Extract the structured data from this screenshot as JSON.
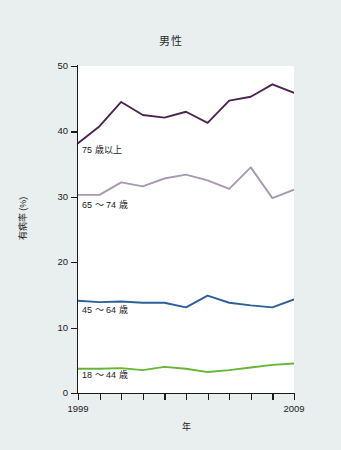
{
  "figure": {
    "background_color": "#e9efee",
    "plot_background_color": "#ffffff",
    "axis_color": "#1b1b1b"
  },
  "chart_data": {
    "type": "line",
    "title": "男性",
    "xlabel": "年",
    "ylabel": "有病率 (%)",
    "xlim": [
      1999,
      2009
    ],
    "ylim": [
      0,
      50
    ],
    "grid": false,
    "legend_position": "inline-labels",
    "x": [
      1999,
      2000,
      2001,
      2002,
      2003,
      2004,
      2005,
      2006,
      2007,
      2008,
      2009
    ],
    "xticks": [
      "1999",
      "",
      "",
      "",
      "",
      "",
      "",
      "",
      "",
      "",
      "2009"
    ],
    "yticks": [
      "0",
      "10",
      "20",
      "30",
      "40",
      "50"
    ],
    "ytick_values": [
      0,
      10,
      20,
      30,
      40,
      50
    ],
    "series": [
      {
        "name": "75 歳以上",
        "color": "#4a2550",
        "values": [
          38.2,
          40.8,
          44.5,
          42.5,
          42.1,
          43.0,
          41.3,
          44.7,
          45.3,
          47.2,
          45.9
        ]
      },
      {
        "name": "65 〜 74 歳",
        "color": "#a89aae",
        "values": [
          30.3,
          30.3,
          32.2,
          31.6,
          32.8,
          33.4,
          32.5,
          31.2,
          34.5,
          29.8,
          31.1
        ]
      },
      {
        "name": "45 〜 64 歳",
        "color": "#2d5f9a",
        "values": [
          14.1,
          13.9,
          14.0,
          13.8,
          13.8,
          13.1,
          14.9,
          13.8,
          13.4,
          13.1,
          14.3
        ]
      },
      {
        "name": "18 〜 44 歳",
        "color": "#67b535",
        "values": [
          3.7,
          3.7,
          3.8,
          3.5,
          4.0,
          3.7,
          3.2,
          3.5,
          3.9,
          4.3,
          4.5
        ]
      }
    ],
    "series_label_positions": [
      {
        "name": "75 歳以上",
        "left": 82,
        "top": 143
      },
      {
        "name": "65 〜 74 歳",
        "left": 82,
        "top": 198
      },
      {
        "name": "45 〜 64 歳",
        "left": 82,
        "top": 303
      },
      {
        "name": "18 〜 44 歳",
        "left": 82,
        "top": 368
      }
    ]
  }
}
